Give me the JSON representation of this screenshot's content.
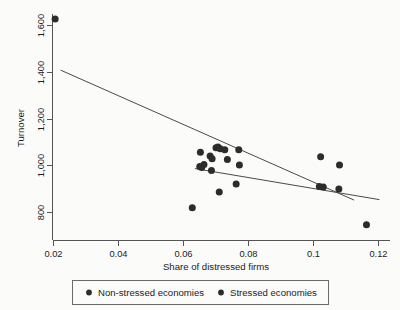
{
  "chart_data": {
    "type": "scatter",
    "title": "",
    "xlabel": "Share of distressed firms",
    "ylabel": "Turnover",
    "xlim": [
      0.018,
      0.122
    ],
    "ylim": [
      720,
      1680
    ],
    "grid": false,
    "legend_position": "bottom",
    "xticks": [
      0.02,
      0.04,
      0.06,
      0.08,
      0.1,
      0.12
    ],
    "xticklabels": [
      "0.02",
      "0.04",
      "0.06",
      "0.08",
      "0.1",
      "0.12"
    ],
    "yticks": [
      800,
      1000,
      1200,
      1400,
      1600
    ],
    "yticklabels": [
      "800",
      "1,000",
      "1,200",
      "1,400",
      "1,600"
    ],
    "series": [
      {
        "name": "Non-stressed economies",
        "marker": "circle",
        "color": "#2c2c2c",
        "points": [
          {
            "x": 0.0205,
            "y": 1628
          },
          {
            "x": 0.0652,
            "y": 1058
          },
          {
            "x": 0.07,
            "y": 1077
          },
          {
            "x": 0.0706,
            "y": 1080
          },
          {
            "x": 0.0713,
            "y": 1073
          },
          {
            "x": 0.0727,
            "y": 1068
          },
          {
            "x": 0.0682,
            "y": 1042
          },
          {
            "x": 0.0688,
            "y": 1030
          },
          {
            "x": 0.0735,
            "y": 1027
          },
          {
            "x": 0.077,
            "y": 1068
          },
          {
            "x": 0.0663,
            "y": 1005
          },
          {
            "x": 0.065,
            "y": 997
          },
          {
            "x": 0.0656,
            "y": 992
          },
          {
            "x": 0.0686,
            "y": 980
          },
          {
            "x": 0.0772,
            "y": 1003
          },
          {
            "x": 0.0762,
            "y": 922
          },
          {
            "x": 0.071,
            "y": 888
          },
          {
            "x": 0.0627,
            "y": 820
          }
        ]
      },
      {
        "name": "Stressed economies",
        "marker": "circle",
        "color": "#2c2c2c",
        "points": [
          {
            "x": 0.1022,
            "y": 1038
          },
          {
            "x": 0.108,
            "y": 1003
          },
          {
            "x": 0.1018,
            "y": 911
          },
          {
            "x": 0.103,
            "y": 909
          },
          {
            "x": 0.1078,
            "y": 901
          },
          {
            "x": 0.1163,
            "y": 748
          }
        ]
      }
    ],
    "fit_lines": [
      {
        "name": "non-stressed-fit",
        "x0": 0.0222,
        "y0": 1409,
        "x1": 0.1125,
        "y1": 853
      },
      {
        "name": "stressed-fit",
        "x0": 0.0635,
        "y0": 988,
        "x1": 0.1203,
        "y1": 855
      }
    ],
    "legend": [
      {
        "label": "Non-stressed economies",
        "marker": "circle",
        "color": "#2c2c2c"
      },
      {
        "label": "Stressed economies",
        "marker": "circle",
        "color": "#2c2c2c"
      }
    ]
  },
  "colors": {
    "marker": "#2c2c2c",
    "axis": "#555555",
    "fitline": "#4a4a4a",
    "background": "#fbfbfa",
    "legend_border": "#6a6a6a"
  }
}
